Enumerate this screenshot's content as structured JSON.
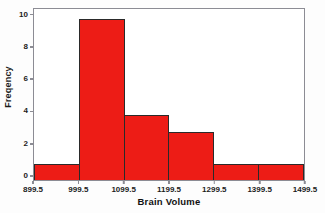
{
  "chart_data": {
    "type": "bar",
    "title": "",
    "subtitle": "",
    "xlabel": "Brain Volume",
    "ylabel": "Freqency",
    "categories": [
      "899.5-999.5",
      "999.5-1099.5",
      "1099.5-1199.5",
      "1199.5-1299.5",
      "1299.5-1399.5",
      "1399.5-1499.5"
    ],
    "values": [
      1,
      10,
      4,
      3,
      1,
      1
    ],
    "bin_edges": [
      899.5,
      999.5,
      1099.5,
      1199.5,
      1299.5,
      1399.5,
      1499.5
    ],
    "bin_width": 100,
    "x_tick_labels": [
      "899.5",
      "999.5",
      "1099.5",
      "1199.5",
      "1299.5",
      "1399.5",
      "1499.5"
    ],
    "y_tick_labels": [
      "0",
      "2",
      "4",
      "6",
      "8",
      "10"
    ],
    "y_tick_values": [
      0,
      2,
      4,
      6,
      8,
      10
    ],
    "xlim": [
      899.5,
      1499.5
    ],
    "ylim": [
      0,
      10.6
    ],
    "grid": false,
    "legend": false,
    "legend_position": "none",
    "bar_color": "#ED1C16",
    "bar_edge_color": "#2A2A2A",
    "frame_color": "#8C8C94",
    "background_color": "#FFFFFF",
    "total_count": 20,
    "annotations": []
  },
  "artifact": {
    "top_fragment": ""
  }
}
